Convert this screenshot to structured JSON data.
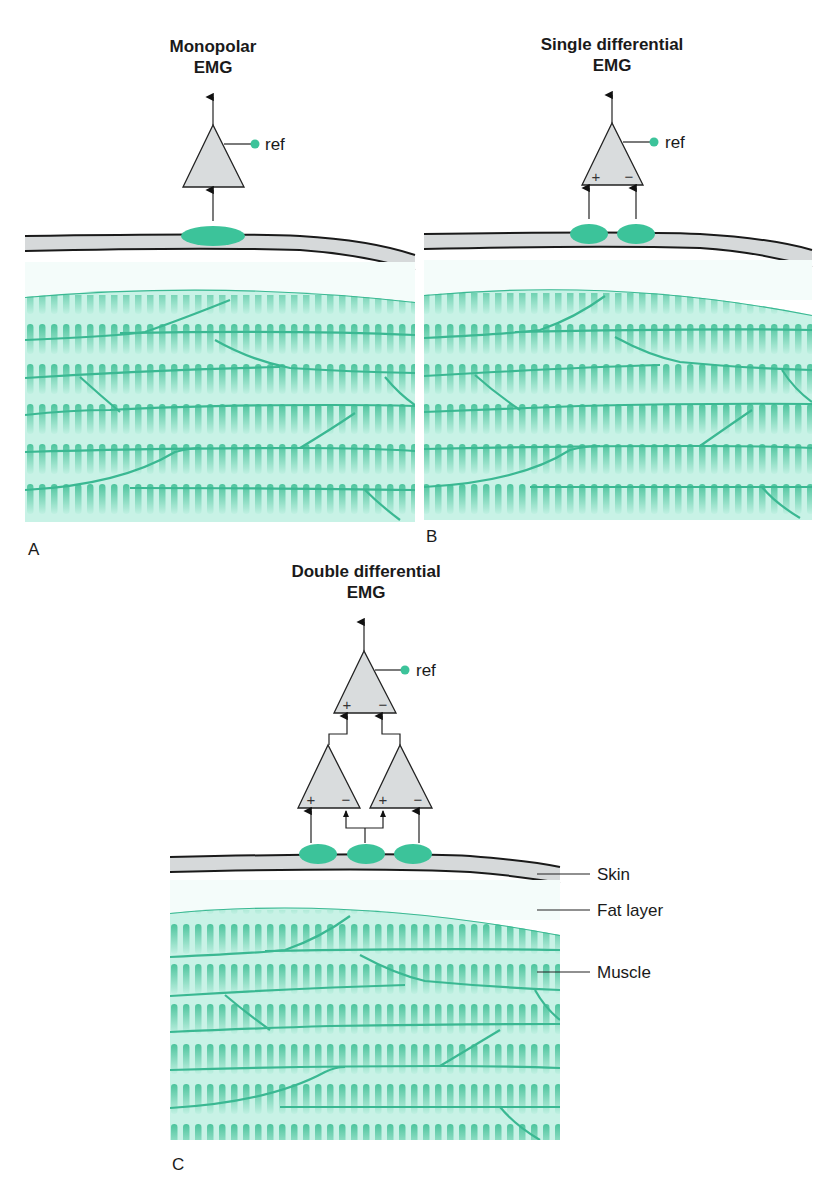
{
  "colors": {
    "electrode": "#3cc39a",
    "muscle_base": "#c8f2e6",
    "muscle_striation": "#47c49c",
    "fiber_border": "#3ab892",
    "skin": "#d6d9da",
    "amplifier": "#d9dcdd",
    "outline": "#222222"
  },
  "panels": [
    {
      "id": "A",
      "label": "A",
      "title_line1": "Monopolar",
      "title_line2": "EMG",
      "ref_label": "ref",
      "amplifiers": [
        {
          "level": "single",
          "signs": []
        }
      ],
      "electrodes": 1
    },
    {
      "id": "B",
      "label": "B",
      "title_line1": "Single differential",
      "title_line2": "EMG",
      "ref_label": "ref",
      "amplifiers": [
        {
          "level": "single",
          "signs": [
            "+",
            "−"
          ]
        }
      ],
      "electrodes": 2
    },
    {
      "id": "C",
      "label": "C",
      "title_line1": "Double differential",
      "title_line2": "EMG",
      "ref_label": "ref",
      "amplifiers": [
        {
          "level": "top",
          "signs": [
            "+",
            "−"
          ]
        },
        {
          "level": "lower-left",
          "signs": [
            "+",
            "−"
          ]
        },
        {
          "level": "lower-right",
          "signs": [
            "+",
            "−"
          ]
        }
      ],
      "electrodes": 3
    }
  ],
  "tissue_labels": {
    "skin": "Skin",
    "fat": "Fat layer",
    "muscle": "Muscle"
  },
  "signs": {
    "plus": "+",
    "minus": "−"
  }
}
